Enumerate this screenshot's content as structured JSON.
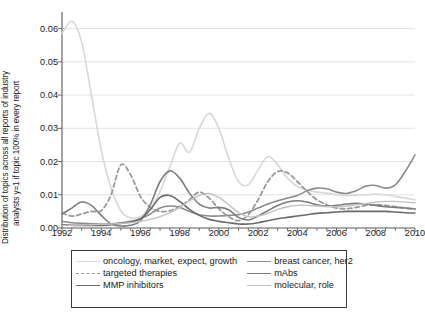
{
  "chart_data": {
    "type": "line",
    "title": "",
    "xlabel": "",
    "ylabel_line1": "Distribution of topics across all reports of industry",
    "ylabel_line2": "analysts y=1 if topic 100% in every report",
    "xlim": [
      1992,
      2010
    ],
    "ylim": [
      0.0,
      0.065
    ],
    "xticks": [
      1992,
      1994,
      1996,
      1998,
      2000,
      2002,
      2004,
      2006,
      2008,
      2010
    ],
    "xtick_labels": [
      "1992",
      "1994",
      "1996",
      "1998",
      "2000",
      "2002",
      "2004",
      "2006",
      "2008",
      "2010"
    ],
    "yticks": [
      0.0,
      0.01,
      0.02,
      0.03,
      0.04,
      0.05,
      0.06
    ],
    "ytick_labels": [
      "0.00",
      "0.01",
      "0.02",
      "0.03",
      "0.04",
      "0.05",
      "0.06"
    ],
    "minor_xtick_step": 0.5,
    "grid": "horizontal",
    "legend_position": "below-center",
    "legend_columns": 2,
    "x": [
      1992,
      1992.5,
      1993,
      1993.5,
      1994,
      1994.5,
      1995,
      1995.5,
      1996,
      1996.5,
      1997,
      1997.5,
      1998,
      1998.5,
      1999,
      1999.5,
      2000,
      2000.5,
      2001,
      2001.5,
      2002,
      2002.5,
      2003,
      2003.5,
      2004,
      2004.5,
      2005,
      2005.5,
      2006,
      2006.5,
      2007,
      2007.5,
      2008,
      2008.5,
      2009,
      2009.5,
      2010
    ],
    "series": [
      {
        "name": "oncology, market, expect, growth",
        "color": "#d8d8d8",
        "style": "solid",
        "width": 1.6,
        "values": [
          0.0585,
          0.0622,
          0.056,
          0.04,
          0.0235,
          0.012,
          0.0052,
          0.003,
          0.0035,
          0.006,
          0.011,
          0.0185,
          0.0255,
          0.0228,
          0.03,
          0.0345,
          0.03,
          0.021,
          0.014,
          0.013,
          0.0175,
          0.0215,
          0.019,
          0.015,
          0.0125,
          0.0115,
          0.0108,
          0.0105,
          0.01,
          0.0098,
          0.0098,
          0.01,
          0.0102,
          0.01,
          0.0095,
          0.009,
          0.0085
        ]
      },
      {
        "name": "breast cancer, her2",
        "color": "#8c8c8c",
        "style": "solid",
        "width": 1.6,
        "values": [
          0.002,
          0.0016,
          0.0014,
          0.0013,
          0.0012,
          0.0013,
          0.0016,
          0.002,
          0.0028,
          0.0042,
          0.006,
          0.0066,
          0.0062,
          0.005,
          0.004,
          0.0036,
          0.0036,
          0.0038,
          0.004,
          0.0048,
          0.006,
          0.0072,
          0.0082,
          0.009,
          0.0098,
          0.0112,
          0.012,
          0.0118,
          0.0108,
          0.0104,
          0.0112,
          0.0126,
          0.0128,
          0.012,
          0.013,
          0.017,
          0.022
        ]
      },
      {
        "name": "targeted therapies",
        "color": "#9a9a9a",
        "style": "dashed",
        "width": 1.8,
        "values": [
          0.0045,
          0.0036,
          0.0042,
          0.005,
          0.0052,
          0.01,
          0.019,
          0.016,
          0.0095,
          0.0062,
          0.005,
          0.0052,
          0.0065,
          0.0085,
          0.0108,
          0.009,
          0.0058,
          0.0034,
          0.0022,
          0.004,
          0.0085,
          0.014,
          0.017,
          0.0166,
          0.014,
          0.011,
          0.0085,
          0.007,
          0.006,
          0.0058,
          0.0062,
          0.0068,
          0.007,
          0.0068,
          0.0064,
          0.006,
          0.0056
        ]
      },
      {
        "name": "mAbs",
        "color": "#7d7d7d",
        "style": "solid",
        "width": 1.6,
        "values": [
          0.0042,
          0.006,
          0.0078,
          0.0068,
          0.0038,
          0.0012,
          0.0006,
          0.0008,
          0.0022,
          0.007,
          0.014,
          0.0172,
          0.015,
          0.0105,
          0.0072,
          0.006,
          0.0062,
          0.0055,
          0.0032,
          0.0024,
          0.0036,
          0.0052,
          0.0068,
          0.0078,
          0.0082,
          0.0078,
          0.007,
          0.0066,
          0.0068,
          0.0072,
          0.0074,
          0.0072,
          0.0068,
          0.0064,
          0.0062,
          0.006,
          0.0058
        ]
      },
      {
        "name": "MMP inhibitors",
        "color": "#6b6b6b",
        "style": "solid",
        "width": 1.6,
        "values": [
          0.001,
          0.0008,
          0.0008,
          0.0008,
          0.0008,
          0.001,
          0.0014,
          0.0018,
          0.0028,
          0.0055,
          0.0092,
          0.0098,
          0.008,
          0.0056,
          0.0038,
          0.0026,
          0.002,
          0.0016,
          0.0012,
          0.0012,
          0.0016,
          0.0022,
          0.0028,
          0.0032,
          0.0036,
          0.004,
          0.0044,
          0.0046,
          0.0048,
          0.005,
          0.005,
          0.005,
          0.005,
          0.005,
          0.0048,
          0.0046,
          0.0045
        ]
      },
      {
        "name": "molecular, role",
        "color": "#c2c2c2",
        "style": "solid",
        "width": 1.4,
        "values": [
          0.0008,
          0.0008,
          0.0009,
          0.001,
          0.0011,
          0.0012,
          0.0014,
          0.0016,
          0.002,
          0.0026,
          0.0034,
          0.0046,
          0.0062,
          0.0082,
          0.0098,
          0.0104,
          0.0092,
          0.007,
          0.0046,
          0.0034,
          0.0036,
          0.0044,
          0.0056,
          0.0064,
          0.0068,
          0.0068,
          0.0066,
          0.0064,
          0.0064,
          0.0066,
          0.007,
          0.0074,
          0.0078,
          0.008,
          0.008,
          0.0078,
          0.0076
        ]
      }
    ],
    "legend_entries": [
      {
        "label": "oncology, market, expect, growth",
        "color": "#d8d8d8",
        "style": "solid"
      },
      {
        "label": "breast cancer, her2",
        "color": "#8c8c8c",
        "style": "solid"
      },
      {
        "label": "targeted therapies",
        "color": "#9a9a9a",
        "style": "dashed"
      },
      {
        "label": "mAbs",
        "color": "#7d7d7d",
        "style": "solid"
      },
      {
        "label": "MMP inhibitors",
        "color": "#6b6b6b",
        "style": "solid"
      },
      {
        "label": "molecular, role",
        "color": "#c2c2c2",
        "style": "solid"
      }
    ]
  }
}
